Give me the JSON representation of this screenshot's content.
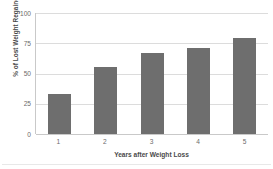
{
  "chart_data": {
    "type": "bar",
    "title": "",
    "xlabel": "Years after Weight Loss",
    "ylabel": "% of Lost Weight Regained",
    "categories": [
      "1",
      "2",
      "3",
      "4",
      "5"
    ],
    "values": [
      33,
      55,
      67,
      71,
      79
    ],
    "ylim": [
      0,
      100
    ],
    "yticks": [
      "0",
      "25",
      "50",
      "75",
      "100"
    ],
    "ytick_values": [
      0,
      25,
      50,
      75,
      100
    ],
    "grid": "horizontal",
    "legend": "none",
    "bar_color": "#6e6e6e",
    "gridline_color": "#dcdcdc",
    "axis_color": "#c9c9c9",
    "text_color": "#4a4a4a",
    "tick_text_color": "#6b6b6b",
    "background": "#ffffff"
  }
}
